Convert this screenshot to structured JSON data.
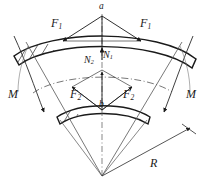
{
  "figure": {
    "colors": {
      "ink": "#1a1a1a",
      "line": "#2b2b2b",
      "hatch": "#3a3a3a",
      "thin": "#555555",
      "background": "#ffffff"
    },
    "labels": {
      "apex_top": "a",
      "apex_mid": "b",
      "force_upper_left": "F",
      "force_upper_left_sub": "1",
      "force_upper_right": "F",
      "force_upper_right_sub": "1",
      "force_lower_left": "F",
      "force_lower_left_sub": "2",
      "force_lower_right": "F",
      "force_lower_right_sub": "2",
      "normal_right": "N",
      "normal_right_sub": "1",
      "normal_left": "N",
      "normal_left_sub": "2",
      "moment_left": "M",
      "moment_right": "M",
      "radius": "R"
    }
  }
}
